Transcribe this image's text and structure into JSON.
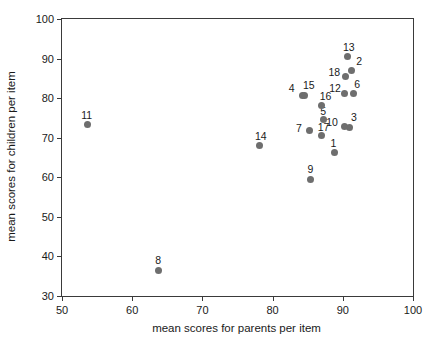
{
  "chart_data": {
    "type": "scatter",
    "title": "",
    "xlabel": "mean scores for parents per item",
    "ylabel": "mean scores for children per item",
    "xlim": [
      50,
      100
    ],
    "ylim": [
      30,
      100
    ],
    "xticks": [
      50,
      60,
      70,
      80,
      90,
      100
    ],
    "yticks": [
      30,
      40,
      50,
      60,
      70,
      80,
      90,
      100
    ],
    "grid": false,
    "legend": "none",
    "marker_color": "#6e6e6e",
    "axis_color": "#3a3a3a",
    "points": [
      {
        "label": "1",
        "x": 88.8,
        "y": 66.2,
        "lx": -4,
        "ly": -15
      },
      {
        "label": "2",
        "x": 91.2,
        "y": 87.0,
        "lx": 5,
        "ly": -14
      },
      {
        "label": "3",
        "x": 90.9,
        "y": 72.6,
        "lx": 2,
        "ly": -15
      },
      {
        "label": "4",
        "x": 84.3,
        "y": 80.6,
        "lx": -14,
        "ly": -13
      },
      {
        "label": "5",
        "x": 87.2,
        "y": 74.5,
        "lx": -3,
        "ly": -14
      },
      {
        "label": "6",
        "x": 91.5,
        "y": 81.2,
        "lx": 1,
        "ly": -14
      },
      {
        "label": "7",
        "x": 85.2,
        "y": 71.8,
        "lx": -13,
        "ly": -8
      },
      {
        "label": "8",
        "x": 63.7,
        "y": 36.5,
        "lx": -3,
        "ly": -15
      },
      {
        "label": "9",
        "x": 85.4,
        "y": 59.5,
        "lx": -3,
        "ly": -15
      },
      {
        "label": "10",
        "x": 90.2,
        "y": 72.8,
        "lx": -18,
        "ly": -10
      },
      {
        "label": "11",
        "x": 53.6,
        "y": 73.3,
        "lx": -6,
        "ly": -15
      },
      {
        "label": "12",
        "x": 90.2,
        "y": 81.2,
        "lx": -15,
        "ly": -10
      },
      {
        "label": "13",
        "x": 90.6,
        "y": 90.5,
        "lx": -4,
        "ly": -15
      },
      {
        "label": "14",
        "x": 78.2,
        "y": 68.0,
        "lx": -5,
        "ly": -15
      },
      {
        "label": "15",
        "x": 84.6,
        "y": 80.6,
        "lx": -2,
        "ly": -16
      },
      {
        "label": "16",
        "x": 87.0,
        "y": 78.2,
        "lx": -2,
        "ly": -14
      },
      {
        "label": "17",
        "x": 87.0,
        "y": 70.5,
        "lx": -4,
        "ly": -14
      },
      {
        "label": "18",
        "x": 90.4,
        "y": 85.5,
        "lx": -17,
        "ly": -9
      }
    ]
  }
}
